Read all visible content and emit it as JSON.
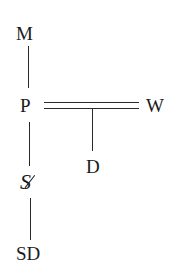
{
  "diagram": {
    "nodes": {
      "m": "M",
      "p": "P",
      "w": "W",
      "d": "D",
      "barred_s": "S",
      "sd": "SD"
    },
    "edges": [
      {
        "from": "M",
        "to": "P",
        "style": "single"
      },
      {
        "from": "P",
        "to": "W",
        "style": "double"
      },
      {
        "from": "P-W",
        "to": "D",
        "style": "single"
      },
      {
        "from": "P",
        "to": "S-barred",
        "style": "single"
      },
      {
        "from": "S-barred",
        "to": "SD",
        "style": "single"
      }
    ]
  }
}
